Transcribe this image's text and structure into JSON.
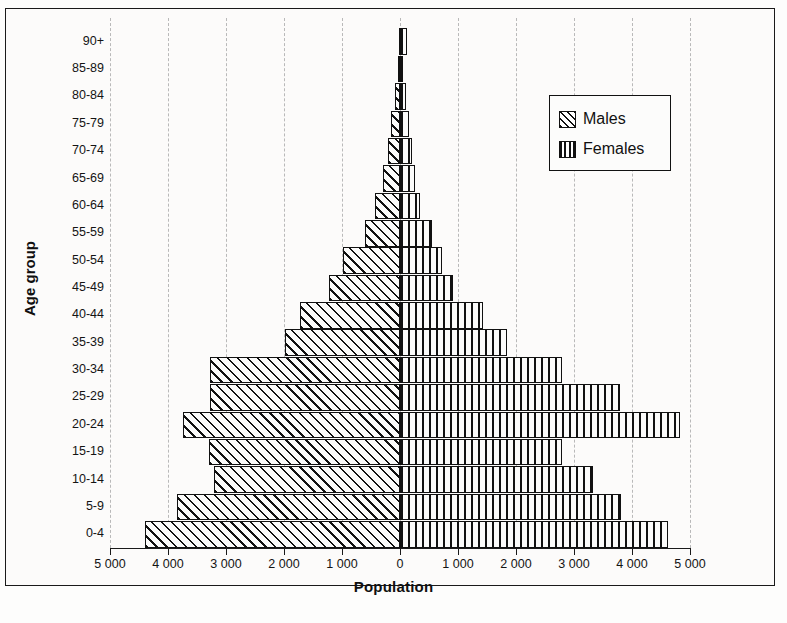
{
  "chart_data": {
    "type": "bar",
    "subtype": "population-pyramid",
    "title": "",
    "xlabel": "Population",
    "ylabel": "Age group",
    "categories": [
      "0-4",
      "5-9",
      "10-14",
      "15-19",
      "20-24",
      "25-29",
      "30-34",
      "35-39",
      "40-44",
      "45-49",
      "50-54",
      "55-59",
      "60-64",
      "65-69",
      "70-74",
      "75-79",
      "80-84",
      "85-89",
      "90+"
    ],
    "xlim": [
      -5000,
      5000
    ],
    "xticks": [
      -5000,
      -4000,
      -3000,
      -2000,
      -1000,
      0,
      1000,
      2000,
      3000,
      4000,
      5000
    ],
    "xticklabels": [
      "5 000",
      "4 000",
      "3 000",
      "2 000",
      "1 000",
      "0",
      "1 000",
      "2 000",
      "3 000",
      "4 000",
      "5 000"
    ],
    "grid": true,
    "grid_style": "dashed-vertical",
    "legend_position": "top-right",
    "series": [
      {
        "name": "Males",
        "direction": "left",
        "pattern": "diagonal-hatch",
        "values": [
          4390,
          3850,
          3210,
          3300,
          3740,
          3280,
          3280,
          1990,
          1720,
          1220,
          985,
          600,
          430,
          300,
          215,
          150,
          85,
          40,
          25
        ]
      },
      {
        "name": "Females",
        "direction": "right",
        "pattern": "vertical-hatch",
        "values": [
          4620,
          3810,
          3330,
          2800,
          4830,
          3800,
          2790,
          1850,
          1430,
          910,
          720,
          560,
          345,
          255,
          200,
          150,
          95,
          50,
          115
        ]
      }
    ]
  },
  "axes": {
    "x_title": "Population",
    "y_title": "Age group"
  },
  "legend": {
    "items": [
      {
        "label": "Males",
        "pattern": "diagonal-hatch"
      },
      {
        "label": "Females",
        "pattern": "vertical-hatch"
      }
    ]
  }
}
